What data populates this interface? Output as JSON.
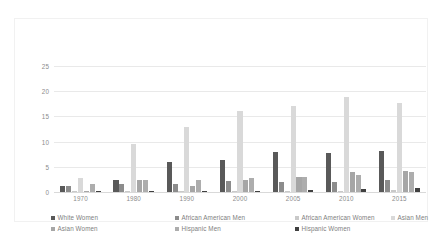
{
  "chart_data": {
    "type": "bar",
    "title": "",
    "subtitle": "",
    "xlabel": "",
    "ylabel": "",
    "categories": [
      "1970",
      "1980",
      "1990",
      "2000",
      "2005",
      "2010",
      "2015"
    ],
    "series": [
      {
        "name": "White Women",
        "color": "#595959",
        "values": [
          1.2,
          2.3,
          5.9,
          6.3,
          7.9,
          7.8,
          8.2
        ]
      },
      {
        "name": "African American Men",
        "color": "#8c8c8c",
        "values": [
          1.2,
          1.5,
          1.5,
          2.1,
          2.0,
          2.0,
          2.3
        ]
      },
      {
        "name": "African American Women",
        "color": "#c9c9c9",
        "values": [
          0.0,
          0.1,
          0.2,
          0.3,
          0.3,
          0.3,
          0.4
        ]
      },
      {
        "name": "Asian Men",
        "color": "#d9d9d9",
        "values": [
          2.8,
          9.5,
          13.0,
          16.0,
          17.0,
          18.8,
          17.6
        ]
      },
      {
        "name": "Asian Women",
        "color": "#a6a6a6",
        "values": [
          0.0,
          2.3,
          1.1,
          2.3,
          2.9,
          4.0,
          4.1
        ]
      },
      {
        "name": "Hispanic Men",
        "color": "#adadad",
        "values": [
          1.5,
          2.4,
          2.3,
          2.7,
          2.9,
          3.4,
          3.9
        ]
      },
      {
        "name": "Hispanic Women",
        "color": "#404040",
        "values": [
          0.0,
          0.1,
          0.2,
          0.3,
          0.4,
          0.5,
          0.7
        ]
      }
    ],
    "yticks": [
      "0",
      "5",
      "10",
      "15",
      "20",
      "25"
    ],
    "ytick_values": [
      0,
      5,
      10,
      15,
      20,
      25
    ],
    "ylim": [
      0,
      29
    ],
    "grid": true,
    "legend_position": "bottom",
    "legend": [
      "White Women",
      "African American Men",
      "African American Women",
      "Asian Men",
      "Asian Women",
      "Hispanic Men",
      "Hispanic Women"
    ]
  },
  "colors": {
    "frame_border": "#f1f1f1",
    "gridline": "#e9e9e9",
    "axis": "#d9d9d9",
    "tick_text": "#8c8c8c",
    "legend_text": "#808080",
    "background": "#ffffff"
  }
}
